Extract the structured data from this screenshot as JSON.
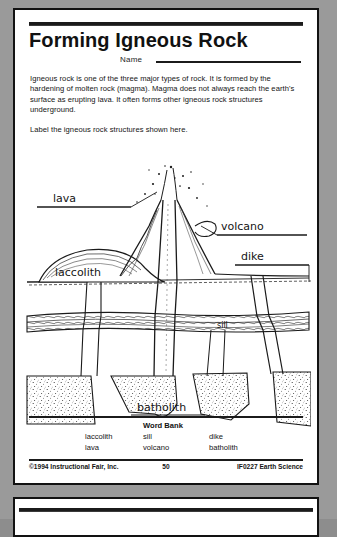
{
  "worksheet": {
    "title": "Forming Igneous Rock",
    "name_label": "Name",
    "paragraph": "Igneous rock is one of the three major types of rock. It is formed by the hardening of molten rock (magma). Magma does not always reach the earth's surface as erupting lava. It often forms other igneous rock structures underground.",
    "instruction": "Label the igneous rock structures shown here."
  },
  "diagram": {
    "labels": {
      "lava": "lava",
      "volcano": "volcano",
      "dike": "dike",
      "laccolith": "laccolith",
      "sill": "sill",
      "batholith": "batholith"
    }
  },
  "word_bank": {
    "title": "Word Bank",
    "columns": [
      [
        "laccolith",
        "lava"
      ],
      [
        "sill",
        "volcano"
      ],
      [
        "dike",
        "batholith"
      ]
    ]
  },
  "footer": {
    "copyright": "©1994 Instructional Fair, Inc.",
    "page_number": "50",
    "product_code": "IF0227 Earth Science"
  },
  "colors": {
    "ink": "#141414",
    "paper": "#ffffff",
    "scan_background": "#9a9a9a"
  }
}
